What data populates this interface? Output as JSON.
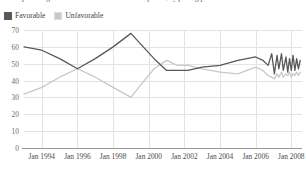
{
  "title": {
    "text": "percentage of Americans with a favorable opinion, by polling period"
  },
  "legend": {
    "position": "top-left",
    "items": [
      {
        "label": "Favorable",
        "color": "#595959",
        "icon": "legend-swatch-icon"
      },
      {
        "label": "Unfavorable",
        "color": "#c8c8c8",
        "icon": "legend-swatch-icon"
      }
    ]
  },
  "chart_data": {
    "type": "line",
    "title": "",
    "xlabel": "",
    "ylabel": "",
    "ylim": [
      0,
      70
    ],
    "yticks": [
      0,
      10,
      20,
      30,
      40,
      50,
      60,
      70
    ],
    "xlim": [
      1993.0,
      2008.6
    ],
    "xticks": [
      1994,
      1996,
      1998,
      2000,
      2002,
      2004,
      2006,
      2008
    ],
    "xtick_labels": [
      "Jan 1994",
      "Jan 1996",
      "Jan 1998",
      "Jan 2000",
      "Jan 2002",
      "Jan 2004",
      "Jan 2006",
      "Jan 2008"
    ],
    "grid": true,
    "legend_position": "top-left",
    "series": [
      {
        "name": "Favorable",
        "color": "#595959",
        "x": [
          1993.0,
          1994.0,
          1995.0,
          1996.0,
          1997.0,
          1998.0,
          1999.0,
          1999.6,
          2000.3,
          2001.0,
          2001.6,
          2002.2,
          2003.0,
          2004.0,
          2005.0,
          2006.0,
          2006.4,
          2006.7,
          2006.9,
          2007.05,
          2007.2,
          2007.3,
          2007.45,
          2007.55,
          2007.7,
          2007.8,
          2007.9,
          2008.0,
          2008.1,
          2008.2,
          2008.3,
          2008.4,
          2008.5
        ],
        "values": [
          60,
          58,
          53,
          47,
          53,
          60,
          68,
          61,
          53,
          46,
          46,
          46,
          48,
          49,
          52,
          54,
          52,
          49,
          56,
          44,
          55,
          47,
          56,
          46,
          54,
          45,
          53,
          46,
          55,
          46,
          53,
          47,
          52
        ]
      },
      {
        "name": "Unfavorable",
        "color": "#c8c8c8",
        "x": [
          1993.0,
          1994.0,
          1995.0,
          1996.0,
          1997.0,
          1998.0,
          1999.0,
          1999.6,
          2000.3,
          2001.0,
          2001.6,
          2002.2,
          2003.0,
          2004.0,
          2005.0,
          2006.0,
          2006.4,
          2006.7,
          2006.9,
          2007.05,
          2007.2,
          2007.3,
          2007.45,
          2007.55,
          2007.7,
          2007.8,
          2007.9,
          2008.0,
          2008.1,
          2008.2,
          2008.3,
          2008.4,
          2008.5
        ],
        "values": [
          32,
          36,
          42,
          47,
          42,
          36,
          30,
          38,
          47,
          52,
          49,
          49,
          47,
          45,
          44,
          48,
          46,
          43,
          42,
          41,
          44,
          42,
          45,
          42,
          44,
          43,
          45,
          42,
          44,
          43,
          45,
          43,
          45
        ]
      }
    ]
  }
}
